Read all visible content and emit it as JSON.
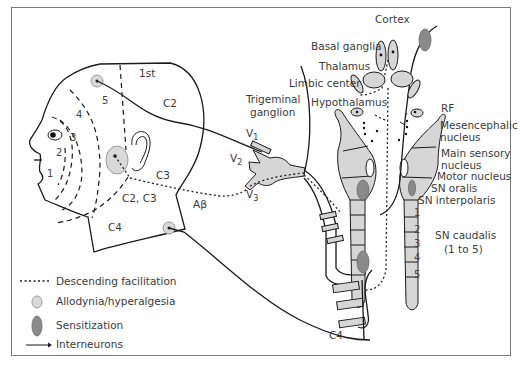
{
  "diagram": {
    "colors": {
      "frame": "#7a7a7a",
      "allodynia_fill": "#d9d9d9",
      "sensitization_fill": "#8a8a8a",
      "nucleus_fill": "#d6d6d6",
      "line": "#1a1a1a",
      "text": "#3a3a3a"
    },
    "head_labels": {
      "first": "1st",
      "c2": "C2",
      "c3": "C3",
      "c2c3": "C2, C3",
      "c4": "C4",
      "abeta": "Aβ",
      "zones": [
        "1",
        "2",
        "3",
        "4",
        "5"
      ]
    },
    "ganglion": {
      "title_line1": "Trigeminal",
      "title_line2": "ganglion",
      "v1": "V",
      "v1_sub": "1",
      "v2": "V",
      "v2_sub": "2",
      "v3": "V",
      "v3_sub": "3"
    },
    "brain_labels": {
      "cortex": "Cortex",
      "basal_ganglia": "Basal ganglia",
      "thalamus": "Thalamus",
      "limbic_center": "Limbic center",
      "hypothalamus": "Hypothalamus",
      "rf": "RF",
      "mesencephalic_1": "Mesencephalic",
      "mesencephalic_2": "nucleus",
      "main_sensory_1": "Main sensory",
      "main_sensory_2": "nucleus",
      "motor_nucleus": "Motor nucleus",
      "sn_oralis": "SN oralis",
      "sn_interpolaris": "SN interpolaris",
      "sn_caudalis_1": "SN caudalis",
      "sn_caudalis_2": "(1 to 5)",
      "caudalis_segments": [
        "1",
        "2",
        "3",
        "4",
        "5"
      ],
      "spinal_c4": "C4"
    },
    "legend": {
      "items": [
        {
          "symbol": "dotted-line",
          "label": "Descending facilitation"
        },
        {
          "symbol": "light-oval",
          "label": "Allodynia/hyperalgesia"
        },
        {
          "symbol": "dark-oval",
          "label": "Sensitization"
        },
        {
          "symbol": "arrow",
          "label": "Interneurons"
        }
      ]
    }
  }
}
